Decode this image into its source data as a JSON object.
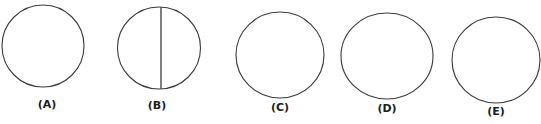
{
  "figure": {
    "title": "",
    "background_color": "#ffffff",
    "stroke_color": "#3a3a3a",
    "label_color": "#1c1c1c",
    "shape_count": 5
  },
  "shapes": [
    {
      "id": "shape-a",
      "label": "(A)",
      "letter": "A",
      "kind": "circle",
      "cx": 43,
      "cy": 46,
      "rx": 41,
      "ry": 41,
      "stroke_width": 1.1,
      "has_chord": false,
      "label_x": 47,
      "label_y": 98
    },
    {
      "id": "shape-b",
      "label": "(B)",
      "letter": "B",
      "kind": "circle-with-chord",
      "cx": 159,
      "cy": 48,
      "rx": 41.5,
      "ry": 41,
      "stroke_width": 1.1,
      "has_chord": true,
      "chord_x": 161,
      "chord_y1": 7.5,
      "chord_y2": 88.5,
      "chord_stroke_width": 1.3,
      "label_x": 157,
      "label_y": 99
    },
    {
      "id": "shape-c",
      "label": "(C)",
      "letter": "C",
      "kind": "circle",
      "cx": 280,
      "cy": 55,
      "rx": 44,
      "ry": 43,
      "stroke_width": 1.1,
      "has_chord": false,
      "label_x": 280,
      "label_y": 101
    },
    {
      "id": "shape-d",
      "label": "(D)",
      "letter": "D",
      "kind": "circle",
      "cx": 387,
      "cy": 56,
      "rx": 46,
      "ry": 43,
      "stroke_width": 1.1,
      "has_chord": false,
      "label_x": 387,
      "label_y": 102
    },
    {
      "id": "shape-e",
      "label": "(E)",
      "letter": "E",
      "kind": "circle",
      "cx": 496,
      "cy": 60,
      "rx": 44,
      "ry": 43,
      "stroke_width": 1.1,
      "has_chord": false,
      "label_x": 496,
      "label_y": 105
    }
  ]
}
